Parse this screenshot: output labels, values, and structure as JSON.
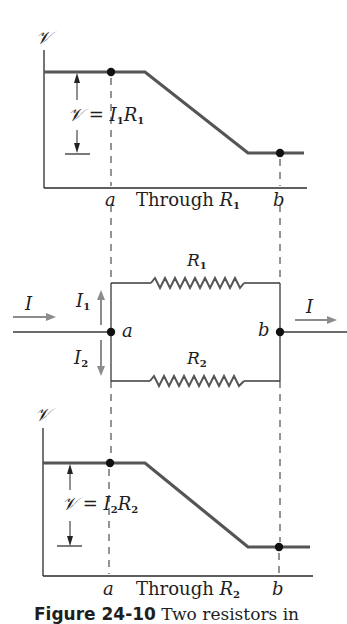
{
  "figure": {
    "caption_label": "Figure 24-10",
    "caption_text": "Two resistors in"
  },
  "top_graph": {
    "y_axis_label": "𝒱",
    "annotation_lhs": "𝒱 = ",
    "annotation_I": "I",
    "annotation_I_sub": "1",
    "annotation_R": "R",
    "annotation_R_sub": "1",
    "point_a": "a",
    "point_b": "b",
    "x_label_text": "Through ",
    "x_label_R": "R",
    "x_label_R_sub": "1"
  },
  "circuit": {
    "input_current": "I",
    "output_current": "I",
    "branch1_current": "I",
    "branch1_current_sub": "1",
    "branch2_current": "I",
    "branch2_current_sub": "2",
    "resistor1_label": "R",
    "resistor1_sub": "1",
    "resistor2_label": "R",
    "resistor2_sub": "2",
    "node_a": "a",
    "node_b": "b"
  },
  "bottom_graph": {
    "y_axis_label": "𝒱",
    "annotation_lhs": "𝒱 = ",
    "annotation_I": "I",
    "annotation_I_sub": "2",
    "annotation_R": "R",
    "annotation_R_sub": "2",
    "point_a": "a",
    "point_b": "b",
    "x_label_text": "Through ",
    "x_label_R": "R",
    "x_label_R_sub": "2"
  },
  "colors": {
    "ink": "#1e1e1e",
    "potential_curve": "#555555",
    "arrow_gray": "#8c8c8c",
    "wire": "#3a3a3a"
  }
}
